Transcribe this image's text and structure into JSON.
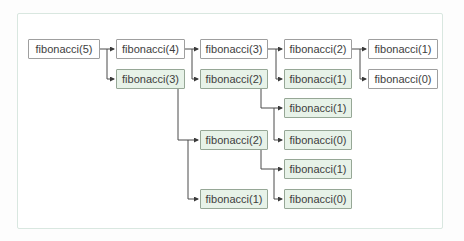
{
  "figure": {
    "type": "recursion-call-tree",
    "function_name": "fibonacci",
    "root_argument": 5
  },
  "colors": {
    "plain_node_fill": "#ffffff",
    "plain_node_border": "#9f9f9f",
    "highlighted_node_fill": "#e7f2e8",
    "highlighted_node_border": "#96a796",
    "connector": "#4b4b4b",
    "frame_border": "#d9e7e0"
  },
  "nodes": [
    {
      "label": "fibonacci(5)",
      "highlighted": false
    },
    {
      "label": "fibonacci(4)",
      "highlighted": false
    },
    {
      "label": "fibonacci(3)",
      "highlighted": false
    },
    {
      "label": "fibonacci(2)",
      "highlighted": false
    },
    {
      "label": "fibonacci(1)",
      "highlighted": false
    },
    {
      "label": "fibonacci(3)",
      "highlighted": true
    },
    {
      "label": "fibonacci(2)",
      "highlighted": true
    },
    {
      "label": "fibonacci(1)",
      "highlighted": true
    },
    {
      "label": "fibonacci(0)",
      "highlighted": false
    },
    {
      "label": "fibonacci(1)",
      "highlighted": true
    },
    {
      "label": "fibonacci(2)",
      "highlighted": true
    },
    {
      "label": "fibonacci(0)",
      "highlighted": true
    },
    {
      "label": "fibonacci(1)",
      "highlighted": true
    },
    {
      "label": "fibonacci(1)",
      "highlighted": true
    },
    {
      "label": "fibonacci(0)",
      "highlighted": true
    }
  ],
  "edges": [
    {
      "from": 0,
      "to": 1
    },
    {
      "from": 0,
      "to": 5
    },
    {
      "from": 1,
      "to": 2
    },
    {
      "from": 1,
      "to": 6
    },
    {
      "from": 2,
      "to": 3
    },
    {
      "from": 2,
      "to": 7
    },
    {
      "from": 3,
      "to": 4
    },
    {
      "from": 3,
      "to": 8
    },
    {
      "from": 6,
      "to": 9
    },
    {
      "from": 6,
      "to": 11
    },
    {
      "from": 5,
      "to": 10
    },
    {
      "from": 5,
      "to": 13
    },
    {
      "from": 10,
      "to": 12
    },
    {
      "from": 10,
      "to": 14
    }
  ]
}
